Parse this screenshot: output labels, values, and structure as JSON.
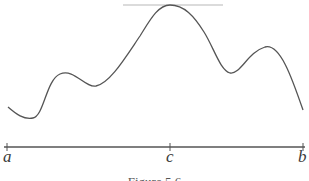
{
  "figure": {
    "labels": {
      "a": "a",
      "c": "c",
      "b": "b"
    },
    "caption": "Figure 5.6",
    "colors": {
      "curve": "#555555",
      "axis": "#555555",
      "tangent": "#b8b8b8",
      "text": "#3a3a3a"
    }
  }
}
